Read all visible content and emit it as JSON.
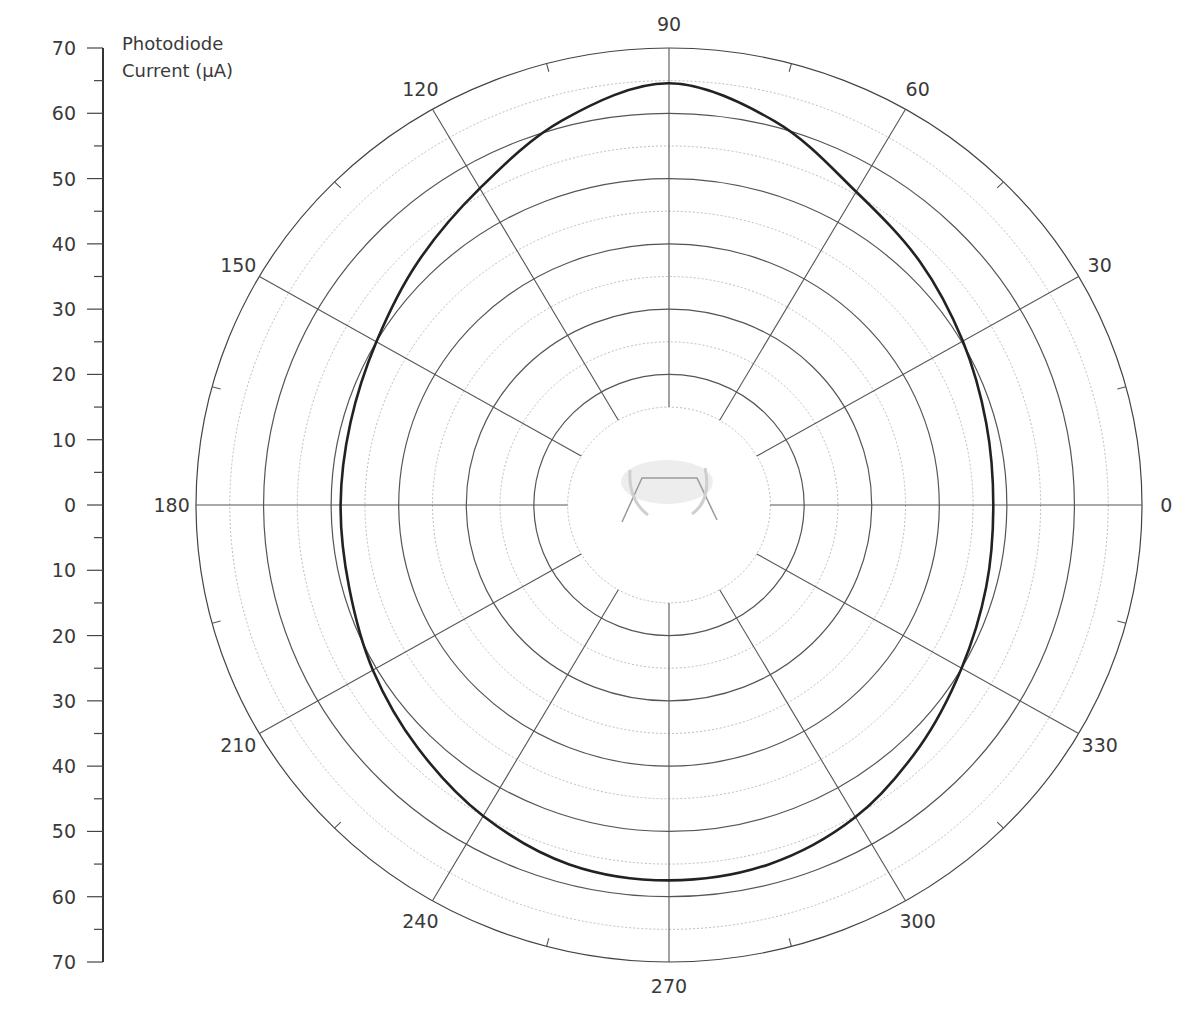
{
  "chart_data": {
    "type": "polar_line",
    "title": "",
    "radial_axis": {
      "label": "Photodiode Current (µA)",
      "range": [
        0,
        70
      ],
      "tick_labels_top": [
        "70",
        "60",
        "50",
        "40",
        "30",
        "20",
        "10",
        "0"
      ],
      "tick_labels_bottom": [
        "10",
        "20",
        "30",
        "40",
        "50",
        "60",
        "70"
      ],
      "major_step": 10,
      "minor_step": 5,
      "rings_solid": [
        20,
        30,
        40,
        50,
        60,
        70
      ],
      "rings_dotted": [
        15,
        25,
        35,
        45,
        55,
        65
      ],
      "inner_blank_radius": 15
    },
    "angular_axis": {
      "unit": "degrees",
      "tick_labels": [
        "0",
        "30",
        "60",
        "90",
        "120",
        "150",
        "180",
        "210",
        "240",
        "270",
        "300",
        "330"
      ],
      "angles": [
        0,
        30,
        60,
        90,
        120,
        150,
        180,
        210,
        240,
        270,
        300,
        330
      ]
    },
    "series": [
      {
        "name": "Photodiode Current",
        "angles": [
          0,
          15,
          30,
          45,
          60,
          75,
          90,
          105,
          120,
          135,
          150,
          165,
          180,
          195,
          210,
          225,
          240,
          255,
          270,
          285,
          300,
          315,
          330,
          345
        ],
        "values": [
          48.0,
          48.6,
          50.2,
          52.6,
          55.4,
          60.8,
          64.6,
          61.0,
          56.0,
          52.6,
          50.0,
          48.8,
          48.6,
          49.0,
          50.6,
          52.6,
          55.0,
          57.0,
          57.5,
          57.0,
          55.2,
          52.4,
          50.0,
          48.6
        ],
        "color": "#222222"
      }
    ],
    "center_image": "sensor-device-sketch"
  }
}
